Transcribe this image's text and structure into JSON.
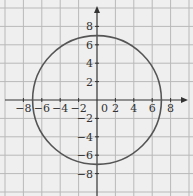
{
  "chart_data": {
    "type": "line",
    "title": "",
    "xlabel": "",
    "ylabel": "",
    "xlim": [
      -10,
      10
    ],
    "ylim": [
      -10,
      10
    ],
    "grid": true,
    "grid_step": 2,
    "x_ticks": [
      "-8",
      "-6",
      "-4",
      "-2",
      "0",
      "2",
      "4",
      "6",
      "8"
    ],
    "y_ticks": [
      "8",
      "6",
      "4",
      "2",
      "-2",
      "-4",
      "-6",
      "-8"
    ],
    "series": [
      {
        "name": "circle",
        "shape": "circle",
        "center": [
          0,
          0
        ],
        "radius": 7
      }
    ],
    "colors": {
      "background": "#efefef",
      "grid": "#b9b9b9",
      "axis": "#333333",
      "curve": "#555555"
    }
  }
}
